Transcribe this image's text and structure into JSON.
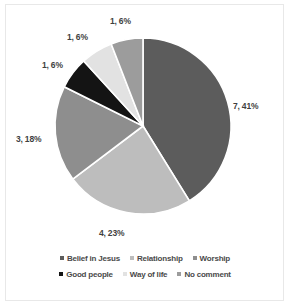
{
  "chart_data": {
    "type": "pie",
    "title": "",
    "subtitle": "",
    "xlabel": "",
    "ylabel": "",
    "grid": false,
    "legend_position": "bottom",
    "start_angle_deg": 0,
    "direction": "clockwise",
    "center": {
      "x": 143,
      "y": 126
    },
    "radius": 88,
    "total_count": 17,
    "categories": [
      "Belief in Jesus",
      "Relationship",
      "Worship",
      "Good people",
      "Way of life",
      "No comment"
    ],
    "values": [
      7,
      4,
      3,
      1,
      1,
      1
    ],
    "percentages": [
      41,
      23,
      18,
      6,
      6,
      6
    ],
    "colors": [
      "#5c5c5c",
      "#bdbdbd",
      "#8e8e8e",
      "#141414",
      "#e2e2e2",
      "#9c9c9c"
    ],
    "slices": [
      {
        "label": "Belief in Jesus",
        "value": 7,
        "percent": 41,
        "data_label": "7, 41%",
        "color": "#5c5c5c"
      },
      {
        "label": "Relationship",
        "value": 4,
        "percent": 23,
        "data_label": "4, 23%",
        "color": "#bdbdbd"
      },
      {
        "label": "Worship",
        "value": 3,
        "percent": 18,
        "data_label": "3, 18%",
        "color": "#8e8e8e"
      },
      {
        "label": "Good people",
        "value": 1,
        "percent": 6,
        "data_label": "1, 6%",
        "color": "#141414"
      },
      {
        "label": "Way of life",
        "value": 1,
        "percent": 6,
        "data_label": "1, 6%",
        "color": "#e2e2e2"
      },
      {
        "label": "No comment",
        "value": 1,
        "percent": 6,
        "data_label": "1, 6%",
        "color": "#9c9c9c"
      }
    ],
    "data_labels": [
      {
        "text": "7, 41%",
        "x": 233,
        "y": 101
      },
      {
        "text": "4, 23%",
        "x": 99,
        "y": 228
      },
      {
        "text": "3, 18%",
        "x": 16,
        "y": 134
      },
      {
        "text": "1, 6%",
        "x": 42,
        "y": 60
      },
      {
        "text": "1, 6%",
        "x": 67,
        "y": 32
      },
      {
        "text": "1, 6%",
        "x": 110,
        "y": 16
      }
    ]
  },
  "legend": {
    "rows": [
      [
        {
          "label": "Belief in Jesus",
          "color": "#5c5c5c"
        },
        {
          "label": "Relationship",
          "color": "#bdbdbd"
        },
        {
          "label": "Worship",
          "color": "#8e8e8e"
        }
      ],
      [
        {
          "label": "Good people",
          "color": "#141414"
        },
        {
          "label": "Way of life",
          "color": "#e2e2e2"
        },
        {
          "label": "No comment",
          "color": "#9c9c9c"
        }
      ]
    ]
  },
  "frame": {
    "border_color": "#e8e8e8",
    "background": "#ffffff"
  }
}
